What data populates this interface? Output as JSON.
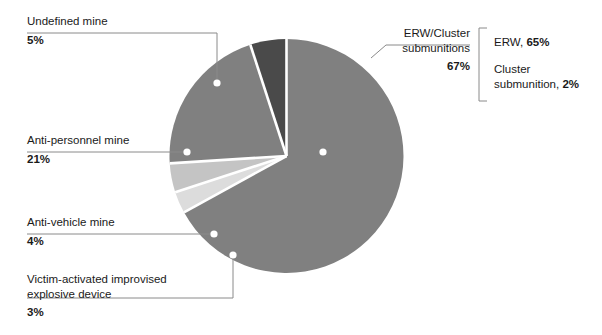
{
  "chart_data": {
    "type": "pie",
    "title": "",
    "unit": "percent",
    "categories": [
      "ERW/Cluster submunitions",
      "Anti-personnel mine",
      "Undefined mine",
      "Anti-vehicle mine",
      "Victim-activated improvised explosive device"
    ],
    "values": [
      67,
      21,
      5,
      4,
      3
    ],
    "colors": [
      "#808080",
      "#808080",
      "#4a4a4a",
      "#c4c4c4",
      "#dcdcdc"
    ],
    "breakdown": {
      "parent": "ERW/Cluster submunitions",
      "items": [
        {
          "label": "ERW",
          "value": 65,
          "text": "ERW, ",
          "pct": "65%"
        },
        {
          "label": "Cluster submunition",
          "value": 2,
          "text": "Cluster submunition, ",
          "pct": "2%"
        }
      ]
    },
    "legend_position": "callout-labels",
    "grid": false
  },
  "labels": {
    "undefined_mine": {
      "name": "Undefined mine",
      "pct": "5%"
    },
    "anti_personnel": {
      "name": "Anti-personnel mine",
      "pct": "21%"
    },
    "anti_vehicle": {
      "name": "Anti-vehicle mine",
      "pct": "4%"
    },
    "vaied": {
      "name_line1": "Victim-activated improvised",
      "name_line2": "explosive device",
      "pct": "3%"
    },
    "erw": {
      "name_line1": "ERW/Cluster",
      "name_line2": "submunitions",
      "pct": "67%"
    }
  },
  "bracket": {
    "erw_text": "ERW, ",
    "erw_pct": "65%",
    "cluster_line1": "Cluster",
    "cluster_line2_text": "submunition, ",
    "cluster_pct": "2%"
  },
  "colors": {
    "slice_main": "#808080",
    "slice_dark": "#4a4a4a",
    "slice_light": "#c4c4c4",
    "slice_lighter": "#dcdcdc",
    "leader": "#8a8a8a",
    "text": "#1a1a1a"
  }
}
